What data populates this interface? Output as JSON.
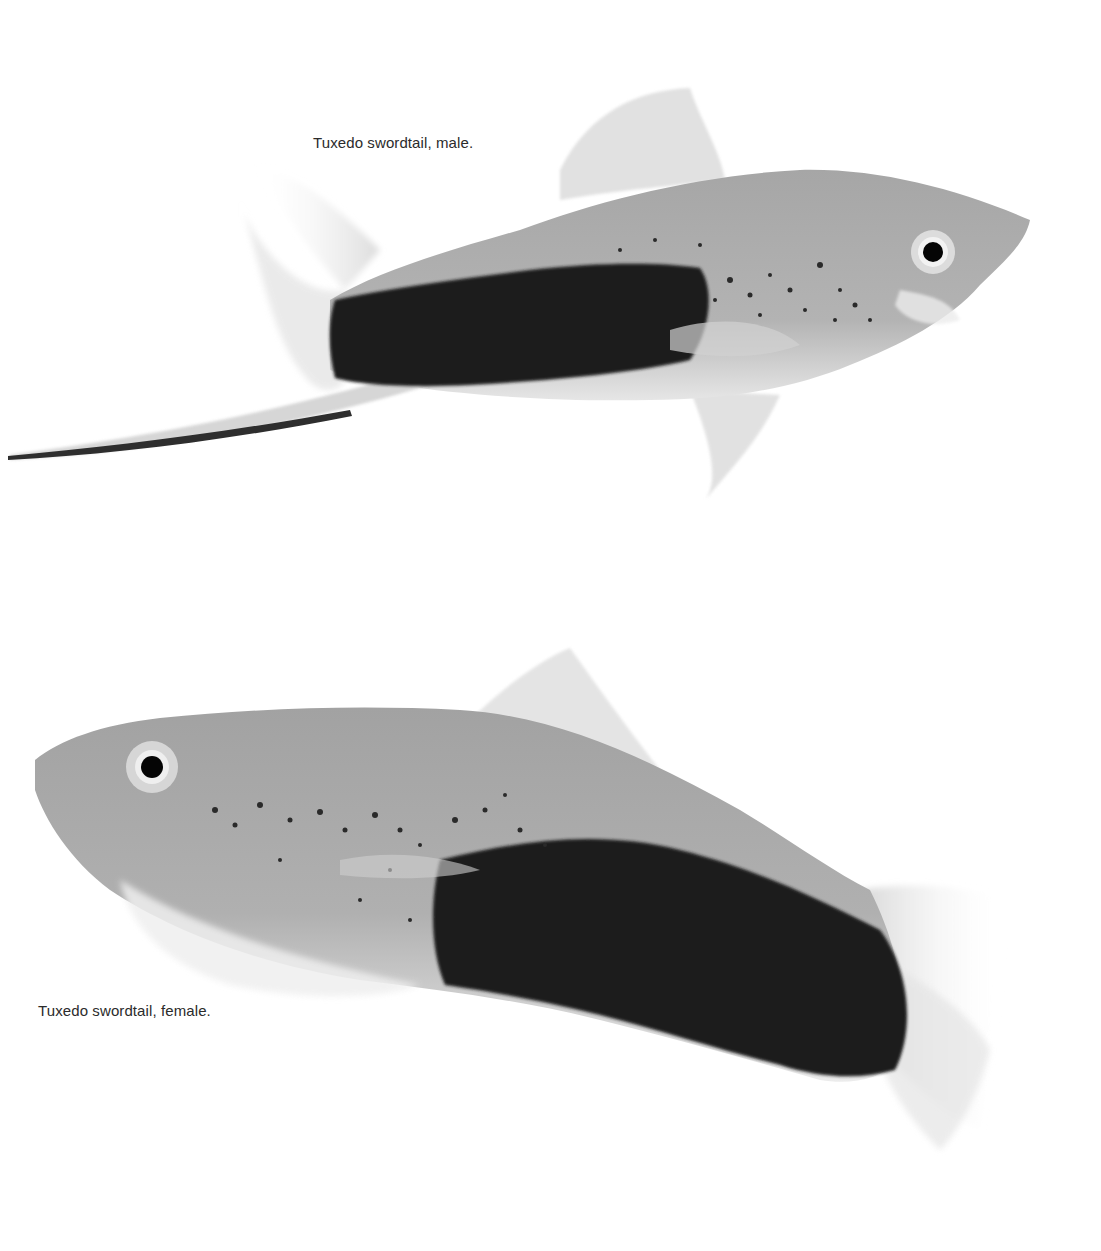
{
  "photo": {
    "background": "#ffffff",
    "subjects": [
      {
        "name": "male",
        "caption": "Tuxedo swordtail, male.",
        "body_color": "#a9a9a9",
        "marking_color": "#1a1a1a"
      },
      {
        "name": "female",
        "caption": "Tuxedo swordtail, female.",
        "body_color": "#a4a4a4",
        "marking_color": "#161616"
      }
    ]
  }
}
